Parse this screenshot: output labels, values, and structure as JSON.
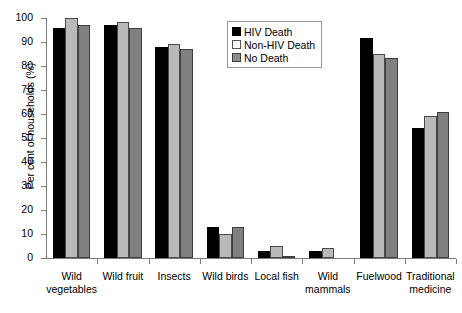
{
  "chart_data": {
    "type": "bar",
    "title": "",
    "xlabel": "",
    "ylabel": "Per cent of households (%)",
    "ylim": [
      0,
      100
    ],
    "ytick_step": 10,
    "yticks": [
      "0",
      "10",
      "20",
      "30",
      "40",
      "50",
      "60",
      "70",
      "80",
      "90",
      "100"
    ],
    "grid": false,
    "legend_position": "top-center",
    "categories": [
      "Wild\nvegetables",
      "Wild fruit",
      "Insects",
      "Wild birds",
      "Local fish",
      "Wild\nmammals",
      "Fuelwood",
      "Traditional\nmedicine"
    ],
    "series": [
      {
        "name": "HIV Death",
        "color": "#000000",
        "values": [
          96,
          97,
          88,
          13,
          3,
          3,
          91.5,
          54
        ]
      },
      {
        "name": "Non-HIV Death",
        "color": "#b9b9b9",
        "values": [
          100,
          98.5,
          89,
          10,
          5,
          4,
          85,
          59
        ]
      },
      {
        "name": "No Death",
        "color": "#808080",
        "values": [
          97,
          96,
          87,
          13,
          1,
          0,
          83.5,
          61
        ]
      }
    ]
  },
  "legend": {
    "items": [
      {
        "label": "HIV Death"
      },
      {
        "label": "Non-HIV Death"
      },
      {
        "label": "No Death"
      }
    ]
  }
}
